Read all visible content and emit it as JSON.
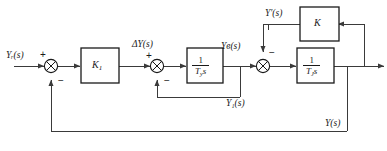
{
  "diagram": {
    "type": "control-block-diagram",
    "line_color": "#3a3a3a",
    "block_border_color": "#1a1a1a",
    "background": "#ffffff"
  },
  "signals": {
    "input": "Yᵣ(s)",
    "delta": "ΔY(s)",
    "mid": "Yв(s)",
    "inner_feedback": "Y₁(s)",
    "rate_feedback": "Y′(s)",
    "output": "Y(s)"
  },
  "blocks": [
    {
      "name": "gain-k1",
      "label": "K",
      "sub": "1"
    },
    {
      "name": "integrator-ty",
      "num": "1",
      "den_base": "T",
      "den_sub": "y",
      "den_tail": "s"
    },
    {
      "name": "integrator-tj",
      "num": "1",
      "den_base": "T",
      "den_sub": "J",
      "den_tail": "s"
    },
    {
      "name": "gain-k",
      "label": "K",
      "sub": ""
    }
  ],
  "junctions": [
    {
      "name": "sum-1",
      "signs": {
        "left": "+",
        "bottom": "−"
      }
    },
    {
      "name": "sum-2",
      "signs": {
        "left": "+",
        "bottom": "−"
      }
    },
    {
      "name": "sum-3",
      "signs": {
        "top": "−"
      }
    }
  ]
}
